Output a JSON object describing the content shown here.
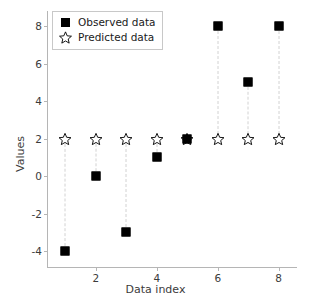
{
  "chart_data": {
    "type": "scatter",
    "title": "",
    "xlabel": "Data index",
    "ylabel": "Values",
    "x": [
      1,
      2,
      3,
      4,
      5,
      6,
      7,
      8
    ],
    "series": [
      {
        "name": "Observed data",
        "marker": "filled-square",
        "values": [
          -4,
          0,
          -3,
          1,
          2,
          8,
          5,
          8
        ]
      },
      {
        "name": "Predicted data",
        "marker": "open-star",
        "values": [
          2,
          2,
          2,
          2,
          2,
          2,
          2,
          2
        ]
      }
    ],
    "xlim": [
      0.4,
      8.6
    ],
    "ylim": [
      -4.9,
      8.8
    ],
    "xticks": [
      2,
      4,
      6,
      8
    ],
    "xtick_labels": [
      "2",
      "4",
      "6",
      "8"
    ],
    "yticks": [
      -4,
      -2,
      0,
      2,
      4,
      6,
      8
    ],
    "ytick_labels": [
      "-4",
      "-2",
      "0",
      "2",
      "4",
      "6",
      "8"
    ],
    "grid": false,
    "legend_position": "upper-left",
    "connectors": "dashed-vertical",
    "colors": {
      "observed": "#000000",
      "predicted": "#000000",
      "connector": "#d2d2d2",
      "axis": "#b5b5b5",
      "text": "#3b3b3b",
      "background": "#ffffff"
    }
  },
  "legend": {
    "entries": [
      {
        "label": "Observed data",
        "icon": "filled-square-icon"
      },
      {
        "label": "Predicted data",
        "icon": "open-star-icon"
      }
    ]
  }
}
